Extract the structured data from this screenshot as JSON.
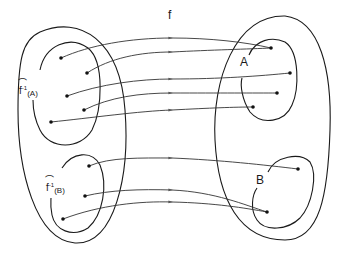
{
  "diagram": {
    "type": "function mapping between sets",
    "function_label": "f",
    "target_subsets": [
      {
        "label": "A"
      },
      {
        "label": "B"
      }
    ],
    "preimages": [
      {
        "label_base": "f",
        "label_exp": "-1",
        "label_arg": "(A)",
        "hat": "⌒"
      },
      {
        "label_base": "f",
        "label_exp": "-1",
        "label_arg": "(B)",
        "hat": "⌒"
      }
    ],
    "colors": {
      "line": "#1a1a1a",
      "background": "#ffffff"
    }
  }
}
